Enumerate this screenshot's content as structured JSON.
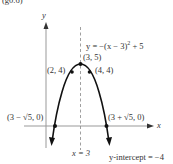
{
  "header": {
    "partial_text": "(g0.6)"
  },
  "axes": {
    "x_label": "x",
    "y_label": "y"
  },
  "equation": {
    "prefix": "y = −(x − 3)",
    "exponent": "2",
    "suffix": " + 5"
  },
  "axis_of_symmetry": {
    "label": "x = 3"
  },
  "points": {
    "vertex": "(3, 5)",
    "left": "(2, 4)",
    "right": "(4, 4)",
    "root_left": "(3 − √5, 0)",
    "root_right": "(3 + √5, 0)"
  },
  "y_intercept": {
    "label": "y-intercept = −4"
  },
  "colors": {
    "curve": "#111111",
    "axis": "#999999",
    "dashed": "#888888",
    "text": "#333333"
  }
}
